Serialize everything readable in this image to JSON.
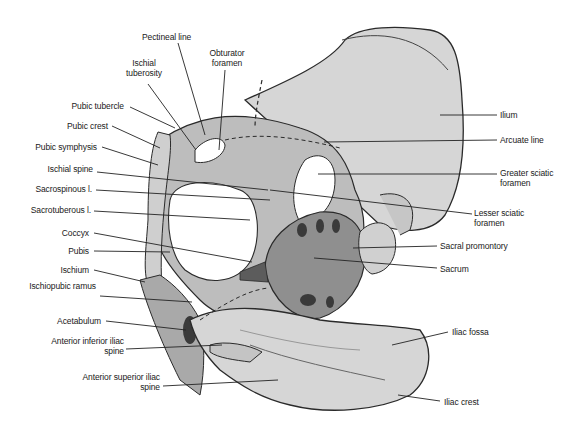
{
  "figure": {
    "colors": {
      "bone": "#d4d4d4",
      "bone_dark": "#9a9a9a",
      "outline": "#2a2a2a",
      "leader": "#222222"
    }
  },
  "labels": {
    "pectineal_line": "Pectineal line",
    "ischial_tuberosity": "Ischial tuberosity",
    "obturator_foramen": "Obturator foramen",
    "pubic_tubercle": "Pubic tubercle",
    "pubic_crest": "Pubic crest",
    "pubic_symphysis": "Pubic symphysis",
    "ischial_spine": "Ischial spine",
    "sacrospinous_l": "Sacrospinous l.",
    "sacrotuberous_l": "Sacrotuberous l.",
    "coccyx": "Coccyx",
    "pubis": "Pubis",
    "ischium": "Ischium",
    "ischiopubic_ramus": "Ischiopubic ramus",
    "acetabulum": "Acetabulum",
    "anterior_inferior_iliac_spine": "Anterior inferior iliac spine",
    "anterior_superior_iliac_spine": "Anterior superior iliac spine",
    "ilium": "Ilium",
    "arcuate_line": "Arcuate line",
    "greater_sciatic_foramen": "Greater sciatic foramen",
    "lesser_sciatic_foramen": "Lesser sciatic foramen",
    "sacral_promontory": "Sacral promontory",
    "sacrum": "Sacrum",
    "iliac_fossa": "Iliac fossa",
    "iliac_crest": "Iliac crest"
  }
}
